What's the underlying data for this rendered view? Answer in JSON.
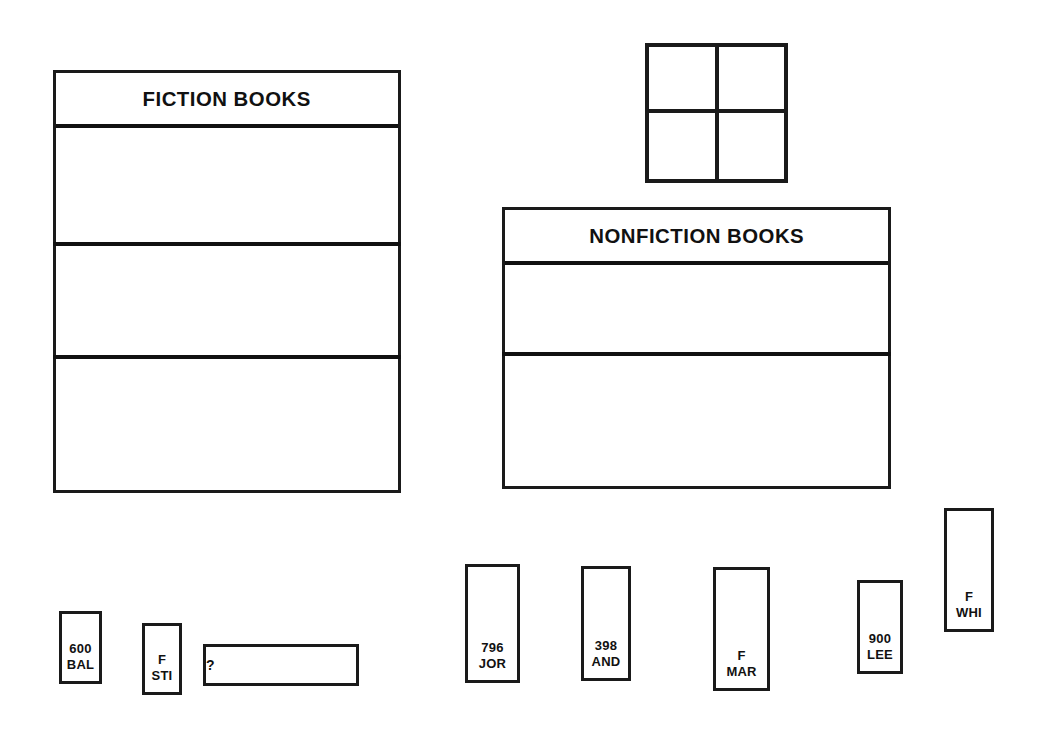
{
  "worksheet": {
    "background_color": "#ffffff",
    "ink_color": "#111111"
  },
  "bookcases": [
    {
      "id": "fiction",
      "title": "FICTION BOOKS",
      "shelf_count": 3,
      "shelves_empty": true
    },
    {
      "id": "nonfiction",
      "title": "NONFICTION BOOKS",
      "shelf_count": 2,
      "shelves_empty": true
    }
  ],
  "window": {
    "name": "window",
    "panes": 4,
    "rows": 2,
    "columns": 2
  },
  "books": [
    {
      "id": "book-600-bal",
      "call_number": "600",
      "author_mark": "BAL",
      "label": "600\nBAL",
      "orientation": "vertical",
      "category": "nonfiction"
    },
    {
      "id": "book-f-sti",
      "call_number": "F",
      "author_mark": "STI",
      "label": "F\nSTI",
      "orientation": "vertical",
      "category": "fiction"
    },
    {
      "id": "book-unknown",
      "call_number": "?",
      "author_mark": "",
      "label": "?",
      "orientation": "horizontal",
      "category": "unknown"
    },
    {
      "id": "book-796-jor",
      "call_number": "796",
      "author_mark": "JOR",
      "label": "796\nJOR",
      "orientation": "vertical",
      "category": "nonfiction"
    },
    {
      "id": "book-398-and",
      "call_number": "398",
      "author_mark": "AND",
      "label": "398\nAND",
      "orientation": "vertical",
      "category": "nonfiction"
    },
    {
      "id": "book-f-mar",
      "call_number": "F",
      "author_mark": "MAR",
      "label": "F\nMAR",
      "orientation": "vertical",
      "category": "fiction"
    },
    {
      "id": "book-900-lee",
      "call_number": "900",
      "author_mark": "LEE",
      "label": "900\nLEE",
      "orientation": "vertical",
      "category": "nonfiction"
    },
    {
      "id": "book-f-whi",
      "call_number": "F",
      "author_mark": "WHI",
      "label": "F\nWHI",
      "orientation": "vertical",
      "category": "fiction"
    }
  ]
}
